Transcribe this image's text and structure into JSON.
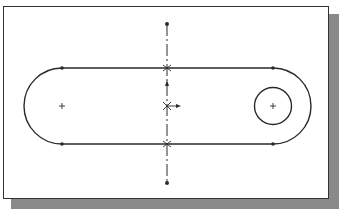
{
  "figure": {
    "type": "sketch"
  },
  "colors": {
    "line": "#2a2a2a",
    "shadow": "#8a8a8a",
    "frame_border": "#333333",
    "background": "#ffffff"
  },
  "sketch": {
    "slot": {
      "left_center": [
        62,
        106
      ],
      "right_center": [
        273,
        106
      ],
      "radius": 38,
      "top_y": 68,
      "bottom_y": 144
    },
    "hole": {
      "center": [
        273,
        106
      ],
      "radius": 18.5
    },
    "centerline": {
      "x": 167,
      "y_top": 24,
      "y_bottom": 183,
      "style": "dash-dot"
    },
    "origin": {
      "point": [
        167,
        106
      ]
    },
    "endpoints": [
      [
        62,
        68
      ],
      [
        273,
        68
      ],
      [
        62,
        144
      ],
      [
        273,
        144
      ],
      [
        167,
        24
      ],
      [
        167,
        183
      ]
    ],
    "center_marks": [
      [
        62,
        106
      ],
      [
        273,
        106
      ]
    ],
    "intersections": [
      [
        167,
        68
      ],
      [
        167,
        144
      ]
    ]
  }
}
